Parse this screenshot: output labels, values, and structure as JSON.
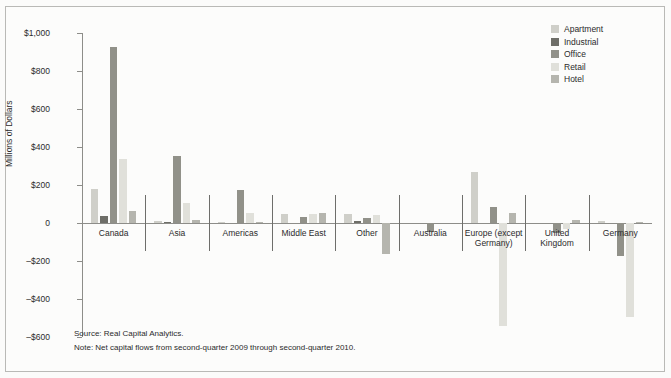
{
  "chart_data": {
    "type": "bar",
    "title": "",
    "xlabel": "",
    "ylabel": "Millions of Dollars",
    "ylim": [
      -600,
      1000
    ],
    "ytick_step": 200,
    "grid": false,
    "legend_position": "top-right",
    "categories": [
      "Canada",
      "Asia",
      "Americas",
      "Middle East",
      "Other",
      "Australia",
      "Europe (except\nGermany)",
      "United\nKingdom",
      "Germany"
    ],
    "ytick_labels": [
      "$1,000",
      "$800",
      "$600",
      "$400",
      "$200",
      "0",
      "–$200",
      "–$400",
      "–$600"
    ],
    "ytick_values": [
      1000,
      800,
      600,
      400,
      200,
      0,
      -200,
      -400,
      -600
    ],
    "series": [
      {
        "name": "Apartment",
        "color": "#cfcfc9",
        "values": [
          180,
          10,
          5,
          50,
          45,
          0,
          270,
          0,
          10
        ]
      },
      {
        "name": "Industrial",
        "color": "#6e6e68",
        "values": [
          35,
          5,
          0,
          0,
          10,
          0,
          0,
          0,
          0
        ]
      },
      {
        "name": "Office",
        "color": "#919189",
        "values": [
          925,
          355,
          175,
          30,
          25,
          -45,
          85,
          -55,
          -175
        ]
      },
      {
        "name": "Retail",
        "color": "#e0e0da",
        "values": [
          335,
          105,
          55,
          50,
          40,
          0,
          -540,
          -30,
          -495
        ]
      },
      {
        "name": "Hotel",
        "color": "#b5b5ae",
        "values": [
          65,
          15,
          5,
          55,
          -165,
          0,
          55,
          15,
          5
        ]
      }
    ],
    "annotations": {
      "source": "Source: Real Capital Analytics.",
      "note": "Note: Net capital flows from second-quarter 2009 through second-quarter 2010."
    }
  },
  "legend": {
    "items": [
      {
        "label": "Apartment",
        "color": "#cfcfc9"
      },
      {
        "label": "Industrial",
        "color": "#6e6e68"
      },
      {
        "label": "Office",
        "color": "#919189"
      },
      {
        "label": "Retail",
        "color": "#e0e0da"
      },
      {
        "label": "Hotel",
        "color": "#b5b5ae"
      }
    ]
  }
}
